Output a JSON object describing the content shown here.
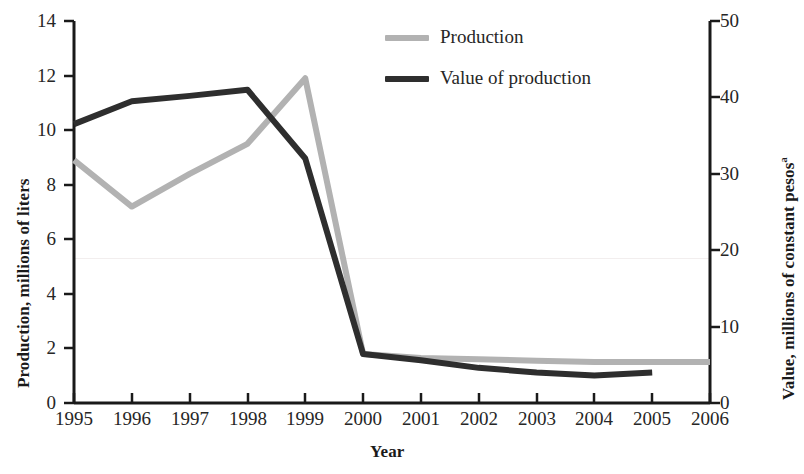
{
  "chart_data": {
    "type": "line",
    "title": "",
    "subtitle": "",
    "xlabel": "Year",
    "ylabel": "Production, millions of liters",
    "y2label": "Value, millions of constant pesos",
    "y2label_superscript": "a",
    "x": [
      1995,
      1996,
      1997,
      1998,
      1999,
      2000,
      2001,
      2002,
      2003,
      2004,
      2005,
      2006
    ],
    "xtick_labels": [
      "1995",
      "1996",
      "1997",
      "1998",
      "1999",
      "2000",
      "2001",
      "2002",
      "2003",
      "2004",
      "2005",
      "2006"
    ],
    "xlim": [
      1995,
      2006
    ],
    "ylim": [
      0,
      14
    ],
    "ytick_labels": [
      "0",
      "2",
      "4",
      "6",
      "8",
      "10",
      "12",
      "14"
    ],
    "yticks": [
      0,
      2,
      4,
      6,
      8,
      10,
      12,
      14
    ],
    "y2lim": [
      0,
      50
    ],
    "y2tick_labels": [
      "0",
      "10",
      "20",
      "30",
      "40",
      "50"
    ],
    "y2ticks": [
      0,
      10,
      20,
      30,
      40,
      50
    ],
    "grid": false,
    "legend_position": "top-center-right",
    "series": [
      {
        "name": "Production",
        "axis": "left",
        "color": "#b2b2b2",
        "x": [
          1995,
          1996,
          1997,
          1998,
          1999,
          2000,
          2001,
          2002,
          2003,
          2004,
          2005,
          2006
        ],
        "values": [
          8.9,
          7.2,
          8.4,
          9.5,
          11.9,
          1.8,
          1.65,
          1.6,
          1.55,
          1.5,
          1.5,
          1.5
        ]
      },
      {
        "name": "Value of production",
        "axis": "right",
        "color": "#2e2e2e",
        "x": [
          1995,
          1996,
          1997,
          1998,
          1999,
          2000,
          2001,
          2002,
          2003,
          2004,
          2005
        ],
        "values": [
          36.5,
          39.5,
          40.2,
          41.0,
          32.0,
          6.4,
          5.6,
          4.6,
          4.0,
          3.6,
          4.0
        ]
      }
    ]
  },
  "legend": {
    "items": [
      {
        "label": "Production",
        "color": "#b2b2b2"
      },
      {
        "label": "Value of production",
        "color": "#2e2e2e"
      }
    ]
  },
  "axes": {
    "left_title": "Production, millions of liters",
    "right_title": "Value, millions of constant pesos",
    "right_title_superscript": "a",
    "x_title": "Year"
  }
}
